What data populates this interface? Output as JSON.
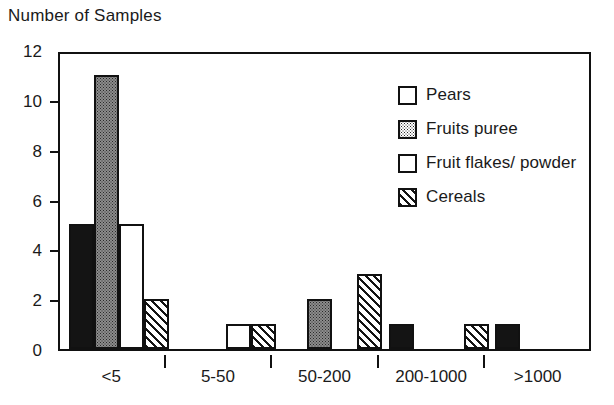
{
  "chart_data": {
    "type": "bar",
    "title": "Number of Samples",
    "xlabel": "",
    "ylabel": "Number of Samples",
    "ylim": [
      0,
      12
    ],
    "yticks": [
      0,
      2,
      4,
      6,
      8,
      10,
      12
    ],
    "grid": false,
    "legend_position": "upper-right",
    "categories": [
      "<5",
      "5-50",
      "50-200",
      "200-1000",
      ">1000"
    ],
    "series": [
      {
        "name": "Pears",
        "pattern": "solid",
        "values": [
          5,
          0,
          0,
          1,
          1
        ]
      },
      {
        "name": "Fruits puree",
        "pattern": "stipple",
        "values": [
          11,
          0,
          2,
          0,
          0
        ]
      },
      {
        "name": "Fruit flakes/ powder",
        "pattern": "empty",
        "values": [
          5,
          1,
          0,
          0,
          0
        ]
      },
      {
        "name": "Cereals",
        "pattern": "hatch",
        "values": [
          2,
          1,
          3,
          1,
          0
        ]
      }
    ]
  },
  "legend": {
    "items": [
      {
        "label": "Pears",
        "swatch": "solid-black-swatch"
      },
      {
        "label": "Fruits puree",
        "swatch": "stippled-gray-swatch"
      },
      {
        "label": "Fruit flakes/ powder",
        "swatch": "white-swatch"
      },
      {
        "label": "Cereals",
        "swatch": "diagonal-hatch-swatch"
      }
    ]
  }
}
